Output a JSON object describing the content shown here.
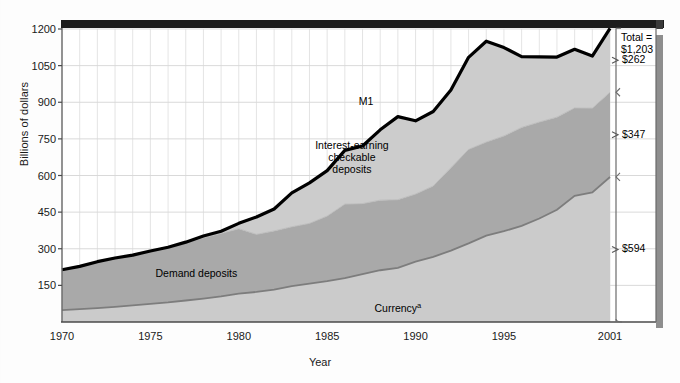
{
  "chart_data": {
    "type": "area",
    "title": "",
    "xlabel": "Year",
    "ylabel": "Billions of dollars",
    "ylim": [
      0,
      1260
    ],
    "xlim": [
      1970,
      2001
    ],
    "yticks": [
      1200,
      1050,
      900,
      750,
      600,
      450,
      300,
      150
    ],
    "xticks": [
      "1970",
      "1975",
      "1980",
      "1985",
      "1990",
      "1995",
      "2001"
    ],
    "xtick_values": [
      1970,
      1975,
      1980,
      1985,
      1990,
      1995,
      2001
    ],
    "grid": true,
    "legend_position": "inline-annotations",
    "stacked": true,
    "x": [
      1970,
      1971,
      1972,
      1973,
      1974,
      1975,
      1976,
      1977,
      1978,
      1979,
      1980,
      1981,
      1982,
      1983,
      1984,
      1985,
      1986,
      1987,
      1988,
      1989,
      1990,
      1991,
      1992,
      1993,
      1994,
      1995,
      1996,
      1997,
      1998,
      1999,
      2000,
      2001
    ],
    "series": [
      {
        "name": "Currency",
        "label": "Currency",
        "superscript": "a",
        "color": "#cbcbcb",
        "values": [
          49,
          53,
          57,
          62,
          68,
          74,
          80,
          88,
          96,
          105,
          116,
          123,
          133,
          147,
          157,
          167,
          180,
          196,
          212,
          222,
          247,
          267,
          292,
          322,
          354,
          372,
          394,
          424,
          460,
          517,
          531,
          594
        ]
      },
      {
        "name": "Demand deposits",
        "label": "Demand deposits",
        "color": "#a9a9a9",
        "values": [
          165,
          175,
          190,
          200,
          206,
          216,
          224,
          236,
          249,
          258,
          266,
          236,
          240,
          243,
          247,
          267,
          303,
          289,
          287,
          279,
          277,
          290,
          340,
          385,
          383,
          390,
          403,
          395,
          379,
          360,
          345,
          347
        ]
      },
      {
        "name": "Interest-earning checkable deposits",
        "label": "Interest-earning checkable deposits",
        "color": "#cccccc",
        "values": [
          0,
          0,
          0,
          0,
          0,
          1,
          2,
          3,
          7,
          9,
          22,
          71,
          90,
          139,
          166,
          186,
          220,
          236,
          288,
          340,
          300,
          305,
          318,
          377,
          413,
          362,
          290,
          267,
          246,
          240,
          213,
          262
        ]
      }
    ],
    "total_line": {
      "name": "M1",
      "label": "M1",
      "color": "#000000",
      "values": [
        214,
        228,
        247,
        262,
        274,
        291,
        306,
        327,
        352,
        372,
        404,
        430,
        463,
        529,
        570,
        620,
        703,
        721,
        787,
        841,
        824,
        862,
        950,
        1084,
        1150,
        1124,
        1087,
        1086,
        1085,
        1117,
        1089,
        1203
      ]
    },
    "annotations": [
      {
        "name": "m1-label",
        "text": "M1",
        "x": 1987.2,
        "y": 905
      },
      {
        "name": "interest-earning-label",
        "text": "Interest-earning\ncheckable\ndeposits",
        "x": 1986.4,
        "y": 675
      },
      {
        "name": "demand-deposits-label",
        "text": "Demand deposits",
        "x": 1977.6,
        "y": 200
      },
      {
        "name": "currency-label",
        "text": "Currency",
        "x": 1989.0,
        "y": 62
      }
    ],
    "right_brackets": [
      {
        "name": "total-callout",
        "lines": [
          "Total =",
          "$1,203"
        ],
        "value": 1203
      },
      {
        "name": "bracket-interest-earning",
        "label": "$262",
        "value": 262,
        "from": 941,
        "to": 1203
      },
      {
        "name": "bracket-demand-deposits",
        "label": "$347",
        "value": 347,
        "from": 594,
        "to": 941
      },
      {
        "name": "bracket-currency",
        "label": "$594",
        "value": 594,
        "from": 0,
        "to": 594
      }
    ]
  },
  "axis": {
    "ylabel": "Billions of dollars",
    "xlabel": "Year",
    "ytick_labels": [
      "1200",
      "1050",
      "900",
      "750",
      "600",
      "450",
      "300",
      "150"
    ],
    "xtick_labels": [
      "1970",
      "1975",
      "1980",
      "1985",
      "1990",
      "1995",
      "2001"
    ]
  },
  "labels": {
    "m1": "M1",
    "interest_earning_1": "Interest-earning",
    "interest_earning_2": "checkable",
    "interest_earning_3": "deposits",
    "demand_deposits": "Demand deposits",
    "currency": "Currency",
    "currency_footnote": "a",
    "total_line1": "Total =",
    "total_line2": "$1,203",
    "bracket_top": "$262",
    "bracket_mid": "$347",
    "bracket_bottom": "$594"
  }
}
